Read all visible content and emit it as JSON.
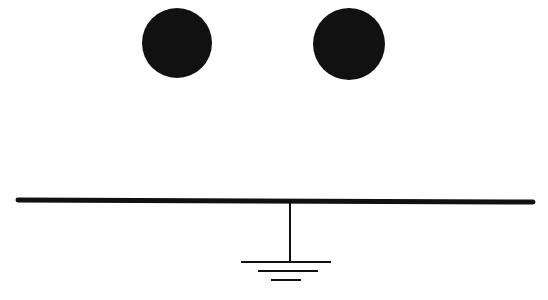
{
  "diagram": {
    "colors": {
      "ink": "#111111",
      "background": "#ffffff"
    },
    "spheres": [
      {
        "name": "left-sphere",
        "cx": 177,
        "cy": 43,
        "r": 35
      },
      {
        "name": "right-sphere",
        "cx": 349,
        "cy": 44,
        "r": 36
      }
    ],
    "plate": {
      "x1": 18,
      "y1": 200,
      "x2": 533,
      "y2": 202,
      "stroke_width": 5
    },
    "ground_wire": {
      "x": 290,
      "y1": 202,
      "y2": 262
    },
    "ground_symbol": [
      {
        "x1": 241,
        "x2": 331,
        "y": 262
      },
      {
        "x1": 258,
        "x2": 318,
        "y": 271
      },
      {
        "x1": 271,
        "x2": 301,
        "y": 280
      }
    ]
  }
}
